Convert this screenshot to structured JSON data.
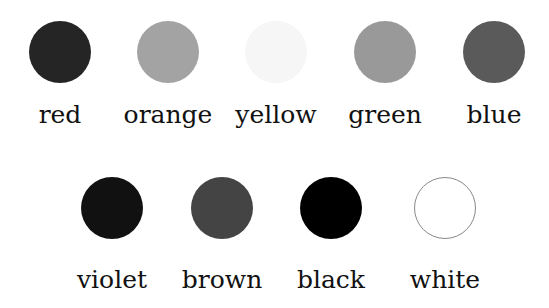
{
  "rows": [
    {
      "swatches": [
        {
          "label": "red",
          "fill": "#252525",
          "border": "none"
        },
        {
          "label": "orange",
          "fill": "#a3a3a3",
          "border": "none"
        },
        {
          "label": "yellow",
          "fill": "#f6f6f6",
          "border": "none"
        },
        {
          "label": "green",
          "fill": "#999999",
          "border": "none"
        },
        {
          "label": "blue",
          "fill": "#5a5a5a",
          "border": "none"
        }
      ]
    },
    {
      "swatches": [
        {
          "label": "violet",
          "fill": "#111111",
          "border": "none"
        },
        {
          "label": "brown",
          "fill": "#444444",
          "border": "none"
        },
        {
          "label": "black",
          "fill": "#000000",
          "border": "none"
        },
        {
          "label": "white",
          "fill": "#ffffff",
          "border": "1px solid #888888"
        }
      ]
    }
  ]
}
